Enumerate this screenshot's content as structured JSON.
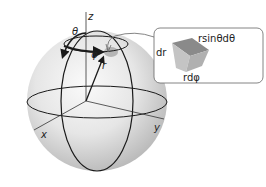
{
  "diagram": {
    "axes": {
      "z": "z",
      "x": "x",
      "y": "y"
    },
    "symbols": {
      "theta": "θ",
      "phi": "φ",
      "r": "r"
    },
    "inset": {
      "dr_label": "dr",
      "rsin_label": "rsinθdθ",
      "rdphi_label": "rdφ"
    },
    "colors": {
      "sphere_light": "#f2f2f2",
      "sphere_dark": "#b8b8b8",
      "line": "#1a1a1a",
      "inset_border": "#666666",
      "element_top": "#8a8a8a",
      "element_side": "#c4c4c4"
    }
  }
}
